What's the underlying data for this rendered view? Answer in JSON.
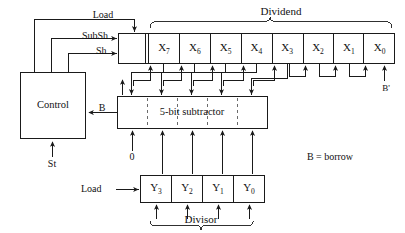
{
  "diagram": {
    "colors": {
      "line": "#1a1a1a",
      "dashed": "#6b6b6b",
      "text": "#111111",
      "background": "#ffffff"
    },
    "blocks": {
      "control": {
        "label": "Control"
      },
      "subtractor": {
        "label": "5-bit subtractor"
      }
    },
    "signals": {
      "load_top": "Load",
      "subsh": "SubSh",
      "sh": "Sh",
      "st": "St",
      "borrow_in": "B",
      "borrow_out": "B'",
      "zero": "0",
      "load_divisor": "Load"
    },
    "groups": {
      "dividend": "Dividend",
      "divisor": "Divisor"
    },
    "notes": {
      "legend": "B = borrow"
    },
    "dividend_register": {
      "shift_cell": "",
      "cells": [
        {
          "base": "X",
          "sub": "7"
        },
        {
          "base": "X",
          "sub": "6"
        },
        {
          "base": "X",
          "sub": "5"
        },
        {
          "base": "X",
          "sub": "4"
        },
        {
          "base": "X",
          "sub": "3"
        },
        {
          "base": "X",
          "sub": "2"
        },
        {
          "base": "X",
          "sub": "1"
        },
        {
          "base": "X",
          "sub": "0"
        }
      ]
    },
    "divisor_register": {
      "cells": [
        {
          "base": "Y",
          "sub": "3"
        },
        {
          "base": "Y",
          "sub": "2"
        },
        {
          "base": "Y",
          "sub": "1"
        },
        {
          "base": "Y",
          "sub": "0"
        }
      ]
    }
  }
}
